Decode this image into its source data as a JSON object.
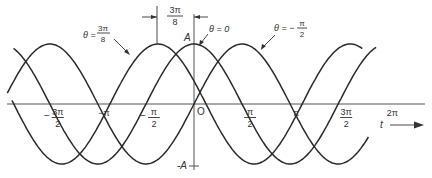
{
  "diagram": {
    "amplitude_label": "A",
    "neg_amplitude_label": "-A",
    "origin_label": "O",
    "time_axis_label": "t",
    "phase_dimension": {
      "num": "3π",
      "den": "8"
    },
    "x_ticks": [
      {
        "sign": "−",
        "num": "3π",
        "den": "2",
        "t": -4.712
      },
      {
        "sign": "",
        "num": "−π",
        "den": "",
        "t": -3.1416
      },
      {
        "sign": "−",
        "num": "π",
        "den": "2",
        "t": -1.5708
      },
      {
        "sign": "",
        "num": "π",
        "den": "2",
        "t": 1.5708
      },
      {
        "sign": "",
        "num": "π",
        "den": "",
        "t": 3.1416
      },
      {
        "sign": "",
        "num": "3π",
        "den": "2",
        "t": 4.712
      },
      {
        "sign": "",
        "num": "2π",
        "den": "",
        "t": 6.2832
      }
    ],
    "curves": [
      {
        "name": "theta-3pi-8",
        "label_prefix": "θ =",
        "label_num": "3π",
        "label_den": "8",
        "theta": 1.1781,
        "t_start": -5.95,
        "t_end": 5.5
      },
      {
        "name": "theta-0",
        "label_prefix": "θ = 0",
        "label_num": "",
        "label_den": "",
        "theta": 0,
        "t_start": -5.9,
        "t_end": 5.95
      },
      {
        "name": "theta-neg-pi-2",
        "label_prefix": "θ = −",
        "label_num": "π",
        "label_den": "2",
        "theta": -1.5708,
        "t_start": -6.1,
        "t_end": 5.7
      }
    ],
    "colors": {
      "ink": "#2a2a2a",
      "axis": "#555555",
      "background": "#ffffff"
    }
  }
}
